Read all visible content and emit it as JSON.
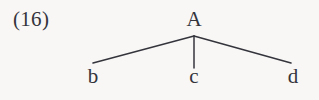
{
  "figure": {
    "example_number": "(16)",
    "background_color": "#f8f7f5",
    "ink_color": "#34343c",
    "root": {
      "label": "A"
    },
    "leaves": [
      {
        "label": "b"
      },
      {
        "label": "c"
      },
      {
        "label": "d"
      }
    ],
    "branches": [
      {
        "name": "branch-to-b",
        "x1": 194,
        "y1": 36,
        "x2": 93,
        "y2": 63
      },
      {
        "name": "branch-to-c",
        "x1": 194,
        "y1": 36,
        "x2": 194,
        "y2": 68
      },
      {
        "name": "branch-to-d",
        "x1": 194,
        "y1": 36,
        "x2": 291,
        "y2": 63
      }
    ]
  }
}
